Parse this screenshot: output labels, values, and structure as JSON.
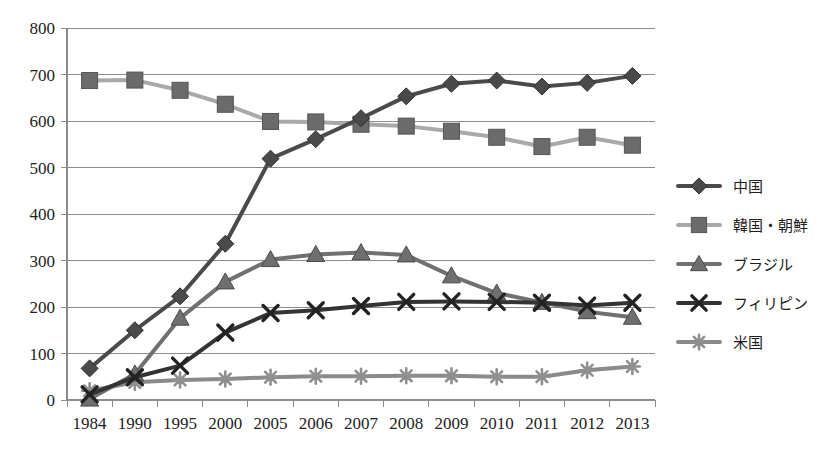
{
  "chart_data": {
    "type": "line",
    "title": "",
    "subtitle": "",
    "xlabel": "",
    "ylabel": "",
    "categories": [
      "1984",
      "1990",
      "1995",
      "2000",
      "2005",
      "2006",
      "2007",
      "2008",
      "2009",
      "2010",
      "2011",
      "2012",
      "2013"
    ],
    "ylim": [
      0,
      800
    ],
    "ytick_step": 100,
    "yticks": [
      "800",
      "700",
      "600",
      "500",
      "400",
      "300",
      "200",
      "100",
      "0"
    ],
    "grid": "horizontal",
    "legend_position": "right",
    "series": [
      {
        "name": "中国",
        "marker": "diamond",
        "color": "#4a4a4a",
        "values": [
          68,
          150,
          223,
          336,
          519,
          561,
          606,
          653,
          680,
          687,
          674,
          682,
          697
        ]
      },
      {
        "name": "韓国・朝鮮",
        "marker": "square",
        "color": "#a9a9a9",
        "values": [
          687,
          688,
          666,
          636,
          599,
          598,
          593,
          589,
          578,
          565,
          545,
          565,
          548
        ]
      },
      {
        "name": "ブラジル",
        "marker": "triangle",
        "color": "#707070",
        "values": [
          2,
          56,
          176,
          254,
          302,
          313,
          317,
          312,
          267,
          230,
          210,
          190,
          178
        ]
      },
      {
        "name": "フィリピン",
        "marker": "cross",
        "color": "#333333",
        "values": [
          12,
          49,
          74,
          145,
          187,
          193,
          202,
          211,
          212,
          211,
          209,
          203,
          209
        ]
      },
      {
        "name": "米国",
        "marker": "asterisk",
        "color": "#8a8a8a",
        "values": [
          20,
          38,
          43,
          45,
          49,
          51,
          51,
          52,
          52,
          50,
          50,
          64,
          72
        ]
      }
    ]
  },
  "legend": {
    "items": [
      {
        "label": "中国"
      },
      {
        "label": "韓国・朝鮮"
      },
      {
        "label": "ブラジル"
      },
      {
        "label": "フィリピン"
      },
      {
        "label": "米国"
      }
    ]
  },
  "colors": {
    "grid": "#8c8c8c",
    "axis": "#8c8c8c",
    "text": "#222222",
    "background": "#ffffff"
  }
}
